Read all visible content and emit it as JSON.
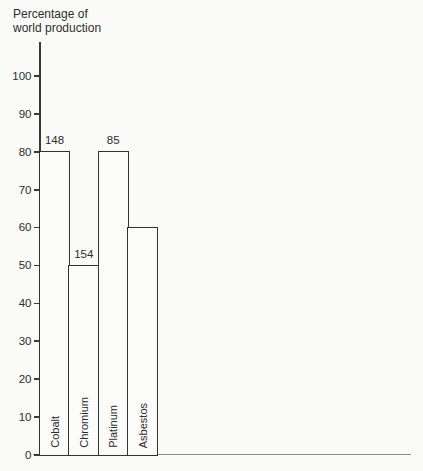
{
  "chart_data": {
    "type": "bar",
    "title": "",
    "ylabel": "Percentage of world production",
    "ylabel_lines": [
      "Percentage of",
      "world production"
    ],
    "xlabel": "",
    "categories": [
      "Cobalt",
      "Chromium",
      "Platinum",
      "Asbestos"
    ],
    "values": [
      80,
      50,
      80,
      60
    ],
    "bar_value_labels": [
      "148",
      "154",
      "85",
      ""
    ],
    "yticks": [
      0,
      10,
      20,
      30,
      40,
      50,
      60,
      70,
      80,
      90,
      100
    ],
    "ylim": [
      0,
      109
    ],
    "grid": false,
    "legend": "none",
    "bar_style": "outlined-adjacent",
    "category_label_position": "inside-bottom-rotated",
    "axis_color": "#3a3a3a",
    "bar_outline_color": "#333333",
    "bar_fill_color": "#fbfbf9",
    "text_color": "#2e2e2e",
    "baseline_extension_color": "#8f8f8f",
    "background_color": "#fafaf9"
  }
}
